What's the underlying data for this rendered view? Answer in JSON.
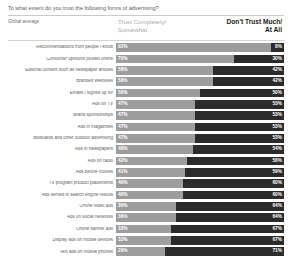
{
  "title": "To what extent do you trust the following forms of advertising?",
  "subtitle": "Global average",
  "headers": {
    "left": "Trust Completely/ Somewhat",
    "left_line1": "Trust Completely/",
    "left_line2": "Somewhat",
    "right_line1": "Don't Trust Much/",
    "right_line2": "At All"
  },
  "colors": {
    "trust_segment": "#9d9d9d",
    "distrust_segment": "#2b2b2b",
    "value_text": "#ffffff",
    "label_text": "#5e5e5e",
    "title_text": "#5a5a5a",
    "header_left_text": "#a9a9a9",
    "header_right_text": "#1a1a1a",
    "background": "#ffffff"
  },
  "chart_data": {
    "type": "bar",
    "title": "To what extent do you trust the following forms of advertising?",
    "subtitle": "Global average",
    "xlabel": "",
    "ylabel": "",
    "xlim": [
      0,
      100
    ],
    "grid": false,
    "legend_position": "top",
    "orientation": "horizontal",
    "stacked": true,
    "categories": [
      "Recommendations from people I know",
      "Consumer opinions posted online",
      "Editorial content such as newspaper articles",
      "Branded Websites",
      "Emails I signed up for",
      "Ads on TV",
      "Brand sponsorships",
      "Ads in magazines",
      "Billboards and other outdoor advertising",
      "Ads in newspapers",
      "Ads on radio",
      "Ads before movies",
      "TV program product placements",
      "Ads served in search engine results",
      "Online video ads",
      "Ads on social networks",
      "Online banner ads",
      "Display ads on mobile devices",
      "Text ads on mobile phones"
    ],
    "series": [
      {
        "name": "Trust Completely/ Somewhat",
        "color": "#9d9d9d",
        "values": [
          92,
          70,
          58,
          58,
          50,
          47,
          47,
          47,
          47,
          46,
          42,
          41,
          40,
          40,
          36,
          36,
          33,
          33,
          29
        ],
        "labels": [
          "92%",
          "70%",
          "58%",
          "58%",
          "50%",
          "47%",
          "47%",
          "47%",
          "47%",
          "46%",
          "42%",
          "41%",
          "40%",
          "40%",
          "36%",
          "36%",
          "33%",
          "33%",
          "29%"
        ]
      },
      {
        "name": "Don't Trust Much/ At All",
        "color": "#2b2b2b",
        "values": [
          8,
          30,
          42,
          42,
          50,
          53,
          53,
          53,
          53,
          54,
          58,
          59,
          60,
          60,
          64,
          64,
          67,
          67,
          71
        ],
        "labels": [
          "8%",
          "30%",
          "42%",
          "42%",
          "50%",
          "53%",
          "53%",
          "53%",
          "53%",
          "54%",
          "58%",
          "59%",
          "60%",
          "60%",
          "64%",
          "64%",
          "67%",
          "67%",
          "71%"
        ]
      }
    ]
  }
}
